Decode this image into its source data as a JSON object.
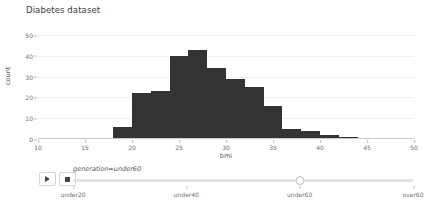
{
  "chart_data": {
    "type": "bar",
    "title": "Diabetes dataset",
    "xlabel": "bmi",
    "ylabel": "count",
    "xlim": [
      10,
      50
    ],
    "ylim": [
      0,
      52
    ],
    "grid": true,
    "legend": "none",
    "bin_width": 2,
    "bar_color": "#333333",
    "x_ticks": [
      10,
      15,
      20,
      25,
      30,
      35,
      40,
      45,
      50
    ],
    "y_ticks": [
      0,
      10,
      20,
      30,
      40,
      50
    ],
    "bins": [
      {
        "x0": 18,
        "x1": 20,
        "value": 6
      },
      {
        "x0": 20,
        "x1": 22,
        "value": 22
      },
      {
        "x0": 22,
        "x1": 24,
        "value": 23
      },
      {
        "x0": 24,
        "x1": 26,
        "value": 40
      },
      {
        "x0": 26,
        "x1": 28,
        "value": 43
      },
      {
        "x0": 28,
        "x1": 30,
        "value": 34
      },
      {
        "x0": 30,
        "x1": 32,
        "value": 29
      },
      {
        "x0": 32,
        "x1": 34,
        "value": 25
      },
      {
        "x0": 34,
        "x1": 36,
        "value": 16
      },
      {
        "x0": 36,
        "x1": 38,
        "value": 5
      },
      {
        "x0": 38,
        "x1": 40,
        "value": 4
      },
      {
        "x0": 40,
        "x1": 42,
        "value": 2
      },
      {
        "x0": 42,
        "x1": 44,
        "value": 1
      }
    ]
  },
  "animation_control": {
    "play_label": "play-animation",
    "stop_label": "stop-animation",
    "play_icon": "play-triangle-icon",
    "stop_icon": "stop-square-icon",
    "slider_label": "generation=under60",
    "slider_value": "under60",
    "slider_value_index": 2,
    "slider_ticks": [
      "under20",
      "under40",
      "under60",
      "over60"
    ]
  }
}
